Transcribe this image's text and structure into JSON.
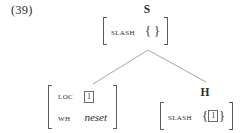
{
  "figure": {
    "example_number": "(39)",
    "type": "hpsg-feature-structure-tree",
    "background_color": "#ffffff",
    "ink_color": "#2b2b2b"
  },
  "nodes": {
    "root": {
      "category_label": "S",
      "avm": {
        "rows": [
          {
            "attribute": "SLASH",
            "value_kind": "set",
            "set_members": [],
            "value_text": "{ }"
          }
        ]
      }
    },
    "left_daughter": {
      "category_label": "",
      "avm": {
        "rows": [
          {
            "attribute": "LOC",
            "value_kind": "tag",
            "tag": "1",
            "value_text": "1"
          },
          {
            "attribute": "WH",
            "value_kind": "italic-type",
            "value_text": "neset"
          }
        ]
      }
    },
    "head_daughter": {
      "category_label": "H",
      "avm": {
        "rows": [
          {
            "attribute": "SLASH",
            "value_kind": "set",
            "set_members": [
              "1"
            ],
            "value_text": "{1}"
          }
        ]
      }
    }
  },
  "edges": [
    {
      "name": "root-to-left-daughter",
      "from": [
        148,
        50
      ],
      "to": [
        93,
        84
      ]
    },
    {
      "name": "root-to-head-daughter",
      "from": [
        148,
        50
      ],
      "to": [
        206,
        82
      ]
    }
  ],
  "glyphs": {
    "brace_open": "{",
    "brace_close": "}"
  }
}
